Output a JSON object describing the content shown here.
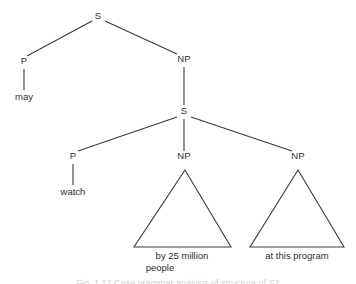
{
  "figure": {
    "type": "syntax-tree",
    "sentence": "may watch by 25 million people at this program",
    "caption": "Fig. 1.12  Case grammar analysis of structure of S2",
    "stroke_color": "#3a3a3a",
    "text_color": "#2f2f2f",
    "background_color": "#ffffff"
  },
  "nodes": {
    "root_s": {
      "label": "S",
      "x": 98,
      "y": 19
    },
    "left_p": {
      "label": "P",
      "x": 24,
      "y": 64
    },
    "upper_np": {
      "label": "NP",
      "x": 184,
      "y": 62
    },
    "lower_s": {
      "label": "S",
      "x": 184,
      "y": 114
    },
    "lower_p": {
      "label": "P",
      "x": 73,
      "y": 159
    },
    "mid_np": {
      "label": "NP",
      "x": 184,
      "y": 159
    },
    "right_np": {
      "label": "NP",
      "x": 298,
      "y": 159
    }
  },
  "leaves": {
    "may": {
      "label": "may",
      "x": 24,
      "y": 100
    },
    "watch": {
      "label": "watch",
      "x": 73,
      "y": 195
    }
  },
  "triangles": {
    "left": {
      "apex_x": 185,
      "apex_y": 170,
      "base_left_x": 134,
      "base_right_x": 231,
      "base_y": 247,
      "lines": [
        "by 25 million",
        "people"
      ]
    },
    "right": {
      "apex_x": 298,
      "apex_y": 170,
      "base_left_x": 250,
      "base_right_x": 344,
      "base_y": 247,
      "lines": [
        "at this program"
      ]
    }
  },
  "edges": [
    {
      "name": "root-s-to-left-p",
      "x1": 92,
      "y1": 21,
      "x2": 27,
      "y2": 56
    },
    {
      "name": "root-s-to-upper-np",
      "x1": 105,
      "y1": 21,
      "x2": 177,
      "y2": 54
    },
    {
      "name": "upper-np-stem-to-lower-s",
      "x1": 184,
      "y1": 66,
      "x2": 184,
      "y2": 105
    },
    {
      "name": "lower-s-to-lower-p",
      "x1": 177,
      "y1": 116,
      "x2": 78,
      "y2": 151
    },
    {
      "name": "lower-s-stem-to-mid-np",
      "x1": 184,
      "y1": 118,
      "x2": 184,
      "y2": 151
    },
    {
      "name": "lower-s-to-right-np",
      "x1": 191,
      "y1": 116,
      "x2": 292,
      "y2": 151
    },
    {
      "name": "left-p-stem-to-may",
      "x1": 24,
      "y1": 69,
      "x2": 24,
      "y2": 90
    },
    {
      "name": "lower-p-stem-to-watch",
      "x1": 73,
      "y1": 164,
      "x2": 73,
      "y2": 185
    }
  ]
}
